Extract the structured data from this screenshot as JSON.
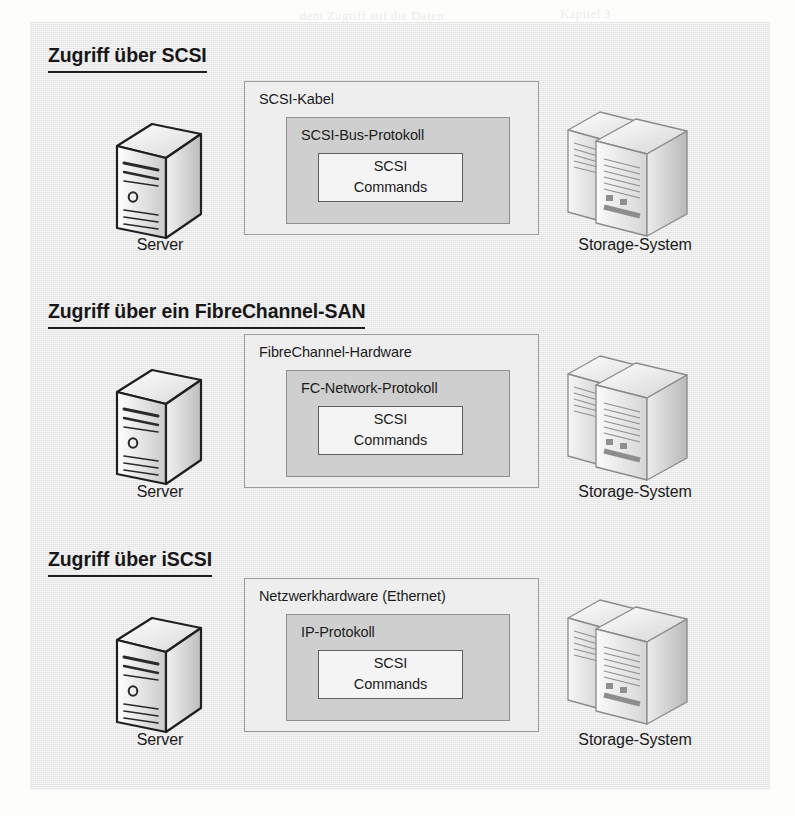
{
  "figure": {
    "sections": [
      {
        "heading": "Zugriff über SCSI",
        "server_label": "Server",
        "storage_label": "Storage-System",
        "outer_box_label": "SCSI-Kabel",
        "middle_box_label": "SCSI-Bus-Protokoll",
        "inner_box_line1": "SCSI",
        "inner_box_line2": "Commands"
      },
      {
        "heading": "Zugriff über ein FibreChannel-SAN",
        "server_label": "Server",
        "storage_label": "Storage-System",
        "outer_box_label": "FibreChannel-Hardware",
        "middle_box_label": "FC-Network-Protokoll",
        "inner_box_line1": "SCSI",
        "inner_box_line2": "Commands"
      },
      {
        "heading": "Zugriff über iSCSI",
        "server_label": "Server",
        "storage_label": "Storage-System",
        "outer_box_label": "Netzwerkhardware (Ethernet)",
        "middle_box_label": "IP-Protokoll",
        "inner_box_line1": "SCSI",
        "inner_box_line2": "Commands"
      }
    ],
    "icons": {
      "server": "server-tower-icon",
      "storage": "storage-array-icon"
    },
    "colors": {
      "panel_background": "#e9e9e9",
      "outer_box_fill": "#eeeeee",
      "middle_box_fill": "#cfcfcf",
      "inner_box_fill": "#f4f4f4",
      "text": "#1a1a1a",
      "border": "#8e8e8e"
    }
  },
  "background_bleed": [
    "dem Zugriff auf die Daten",
    "Kapitel 3",
    "SCSI-Befehle werden über",
    "Protokoll gekapselt und",
    "die Hardware übertragen",
    "Im Gegensatz dazu",
    "Speichernetz verwendet",
    "FibreChannel-SAN",
    "iSCSI-Verbindungen",
    "über IP-Netze",
    "Abbildung 3.1",
    "Der Server greift",
    "auf das Storage-System",
    "zu und nutzt dabei",
    "SCSI-Kommandos"
  ]
}
